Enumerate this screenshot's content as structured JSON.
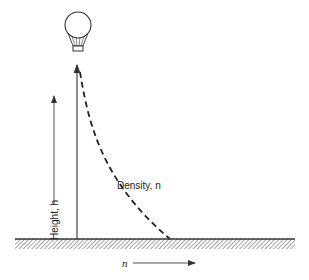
{
  "diagram": {
    "title": "",
    "labels": {
      "height_axis": "Height, h",
      "density_curve": "Density, n",
      "x_axis_symbol": "n"
    },
    "elements": [
      {
        "type": "balloon",
        "description": "hot-air / weather balloon with basket at top of vertical line"
      },
      {
        "type": "vertical-line",
        "description": "balloon tether / height line from ground up to balloon"
      },
      {
        "type": "arrow",
        "description": "height arrow pointing upward on left"
      },
      {
        "type": "dashed-curve",
        "description": "density decreasing with height"
      },
      {
        "type": "ground",
        "description": "hatched ground surface"
      },
      {
        "type": "arrow",
        "description": "n axis arrow pointing right"
      }
    ],
    "colors": {
      "ink": "#333333",
      "background": "#ffffff"
    }
  }
}
